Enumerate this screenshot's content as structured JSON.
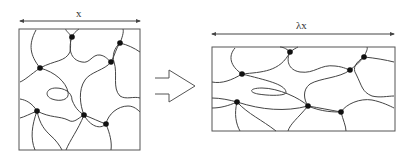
{
  "diagram": {
    "before": {
      "dimension_label": "x",
      "crosslink_count": 7
    },
    "transition_arrow": "open-arrow-right",
    "after": {
      "dimension_label": "λx",
      "crosslink_count": 7
    },
    "colors": {
      "line": "#444444",
      "node": "#111111",
      "background": "#ffffff"
    }
  }
}
